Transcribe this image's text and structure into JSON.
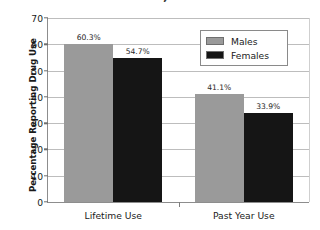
{
  "chart_data": {
    "type": "bar",
    "title": "Gender, 2013",
    "title_clipped": true,
    "xlabel": "",
    "ylabel": "Percentage Reporting Drug Use",
    "categories": [
      "Lifetime Use",
      "Past Year Use"
    ],
    "series": [
      {
        "name": "Males",
        "color": "#9a9a9a",
        "values": [
          60.3,
          41.1
        ],
        "labels": [
          "60.3%",
          "41.1%"
        ]
      },
      {
        "name": "Females",
        "color": "#151515",
        "values": [
          54.7,
          33.9
        ],
        "labels": [
          "54.7%",
          "33.9%"
        ]
      }
    ],
    "ylim": [
      0,
      70
    ],
    "ytick_step": 10,
    "ytick_labels": [
      "0",
      "10",
      "20",
      "30",
      "40",
      "50",
      "60",
      "70"
    ],
    "grid": true,
    "legend_position": "upper right"
  },
  "colors": {
    "males": "#9a9a9a",
    "females": "#151515",
    "grid": "#bdbdbd",
    "axis": "#8d8d8d",
    "background": "#ffffff"
  }
}
